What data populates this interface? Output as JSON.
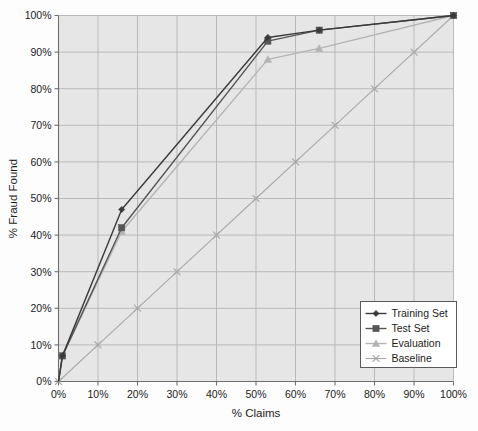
{
  "chart_data": {
    "type": "line",
    "title": "",
    "xlabel": "% Claims",
    "ylabel": "% Fraud Found",
    "xlim": [
      0,
      100
    ],
    "ylim": [
      0,
      100
    ],
    "grid": true,
    "legend_position": "bottom-right",
    "x_tick_labels": [
      "0%",
      "10%",
      "20%",
      "30%",
      "40%",
      "50%",
      "60%",
      "70%",
      "80%",
      "90%",
      "100%"
    ],
    "y_tick_labels": [
      "0%",
      "10%",
      "20%",
      "30%",
      "40%",
      "50%",
      "60%",
      "70%",
      "80%",
      "90%",
      "100%"
    ],
    "x_ticks": [
      0,
      10,
      20,
      30,
      40,
      50,
      60,
      70,
      80,
      90,
      100
    ],
    "y_ticks": [
      0,
      10,
      20,
      30,
      40,
      50,
      60,
      70,
      80,
      90,
      100
    ],
    "series": [
      {
        "name": "Training Set",
        "marker": "diamond",
        "color": "#3a3a3a",
        "x": [
          0,
          1,
          16,
          53,
          66,
          100
        ],
        "y": [
          0,
          7,
          47,
          94,
          96,
          100
        ]
      },
      {
        "name": "Test Set",
        "marker": "square",
        "color": "#555555",
        "x": [
          0,
          1,
          16,
          53,
          66,
          100
        ],
        "y": [
          0,
          7,
          42,
          93,
          96,
          100
        ]
      },
      {
        "name": "Evaluation",
        "marker": "triangle",
        "color": "#b4b4b4",
        "x": [
          0,
          1,
          16,
          53,
          66,
          100
        ],
        "y": [
          0,
          7,
          41,
          88,
          91,
          100
        ]
      },
      {
        "name": "Baseline",
        "marker": "x",
        "color": "#a8a8a8",
        "x": [
          0,
          10,
          20,
          30,
          40,
          50,
          60,
          70,
          80,
          90,
          100
        ],
        "y": [
          0,
          10,
          20,
          30,
          40,
          50,
          60,
          70,
          80,
          90,
          100
        ]
      }
    ]
  },
  "colors": {
    "plot_background": "#e6e6e6",
    "page_background": "#fdfdfd",
    "gridline": "#b9b9b9",
    "axis": "#6f6f6f",
    "text": "#1b1b1b",
    "legend_background": "#ffffff",
    "legend_border": "#5a5a5a"
  },
  "legend": {
    "items": [
      {
        "label": "Training Set"
      },
      {
        "label": "Test Set"
      },
      {
        "label": "Evaluation"
      },
      {
        "label": "Baseline"
      }
    ]
  }
}
